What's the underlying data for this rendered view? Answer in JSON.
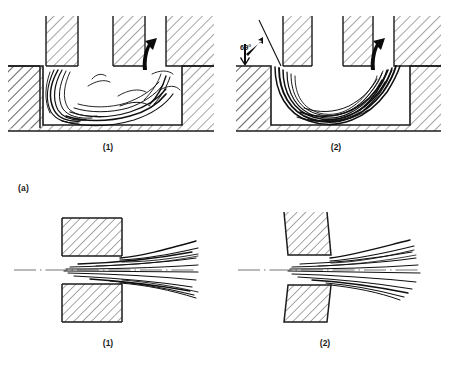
{
  "figure": {
    "title": "",
    "header_left": "",
    "header_right": "",
    "subfigure_a_label": "(a)",
    "rows": [
      {
        "id": "row-a",
        "kind": "cavity-flow",
        "panels": [
          {
            "id": "a1",
            "label": "(1)",
            "angle_label": "",
            "flow_arrow": "up-arrow"
          },
          {
            "id": "a2",
            "label": "(2)",
            "angle_label": "69°",
            "flow_arrow": "up-arrow"
          }
        ]
      },
      {
        "id": "row-b",
        "kind": "nozzle-jet-flow",
        "panels": [
          {
            "id": "b1",
            "label": "(1)",
            "angle_label": "",
            "flow_arrow": ""
          },
          {
            "id": "b2",
            "label": "(2)",
            "angle_label": "",
            "flow_arrow": ""
          }
        ]
      }
    ]
  },
  "labels": {
    "a_caption": "(a)",
    "top_left_panel": "(1)",
    "top_right_panel": "(2)",
    "bottom_left_panel": "(1)",
    "bottom_right_panel": "(2)",
    "angle": "69°"
  },
  "colors": {
    "ink": "#1b1b1b",
    "hatch": "#2b2b2b",
    "stream": "#101010",
    "background": "#ffffff"
  }
}
